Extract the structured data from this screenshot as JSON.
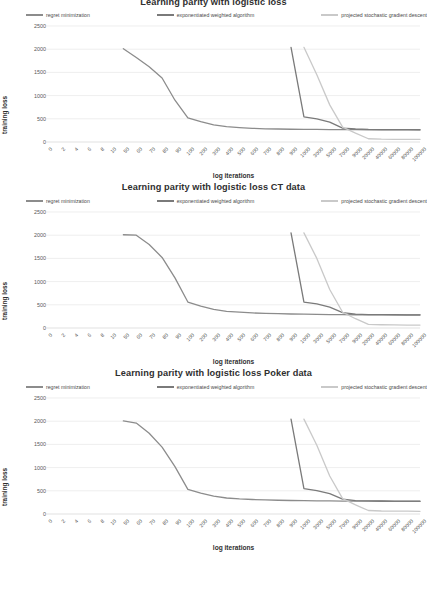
{
  "figure": {
    "background": "#ffffff",
    "series_colors": {
      "regret_minimization": "#8c8c8c",
      "exponentiated_weighted_algorithm": "#7a7a7a",
      "projected_stochastic_gradient_descent": "#c9c9c9"
    },
    "gridline_color": "#e2e2e2",
    "axis_color": "#d9d9d9"
  },
  "charts": [
    {
      "title": "Learning parity with logistic loss",
      "title_clipped": true,
      "legend": [
        {
          "label": "regret minimization",
          "color": "#8c8c8c"
        },
        {
          "label": "exponentiated weighted algorithm",
          "color": "#7a7a7a"
        },
        {
          "label": "projected stochastic gradient descent",
          "color": "#c9c9c9"
        }
      ],
      "chart_data": {
        "type": "line",
        "title": "Learning parity with logistic loss",
        "xlabel": "log iterations",
        "ylabel": "training loss",
        "ylim": [
          0,
          2500
        ],
        "yticks": [
          0,
          500,
          1000,
          1500,
          2000,
          2500
        ],
        "grid": true,
        "legend_position": "top",
        "categories": [
          "0",
          "2",
          "4",
          "6",
          "8",
          "10",
          "50",
          "60",
          "70",
          "80",
          "90",
          "100",
          "200",
          "300",
          "400",
          "500",
          "600",
          "700",
          "800",
          "900",
          "1000",
          "3000",
          "5000",
          "7000",
          "9000",
          "20000",
          "40000",
          "60000",
          "80000",
          "100000"
        ],
        "series": [
          {
            "name": "regret minimization",
            "color": "#8c8c8c",
            "values": [
              null,
              null,
              null,
              null,
              null,
              null,
              2010,
              1820,
              1620,
              1380,
              900,
              520,
              440,
              370,
              330,
              310,
              295,
              285,
              280,
              275,
              272,
              270,
              268,
              266,
              265,
              263,
              262,
              261,
              260,
              260
            ]
          },
          {
            "name": "exponentiated weighted algorithm",
            "color": "#7a7a7a",
            "values": [
              null,
              null,
              null,
              null,
              null,
              null,
              null,
              null,
              null,
              null,
              null,
              null,
              null,
              null,
              null,
              null,
              null,
              null,
              null,
              2040,
              540,
              500,
              430,
              300,
              280,
              270,
              268,
              266,
              265,
              264
            ]
          },
          {
            "name": "projected stochastic gradient descent",
            "color": "#c9c9c9",
            "values": [
              null,
              null,
              null,
              null,
              null,
              null,
              null,
              null,
              null,
              null,
              null,
              null,
              null,
              null,
              null,
              null,
              null,
              null,
              null,
              null,
              2040,
              1450,
              800,
              320,
              190,
              70,
              60,
              58,
              56,
              55
            ]
          }
        ]
      }
    },
    {
      "title": "Learning parity with logistic loss CT data",
      "title_clipped": false,
      "legend": [
        {
          "label": "regret minimization",
          "color": "#8c8c8c"
        },
        {
          "label": "exponentiated weighted algorithm",
          "color": "#7a7a7a"
        },
        {
          "label": "projected stochastic gradient descent",
          "color": "#c9c9c9"
        }
      ],
      "chart_data": {
        "type": "line",
        "title": "Learning parity with logistic loss CT data",
        "xlabel": "log iterations",
        "ylabel": "training loss",
        "ylim": [
          0,
          2500
        ],
        "yticks": [
          0,
          500,
          1000,
          1500,
          2000,
          2500
        ],
        "grid": true,
        "legend_position": "top",
        "categories": [
          "0",
          "2",
          "4",
          "6",
          "8",
          "10",
          "50",
          "60",
          "70",
          "80",
          "90",
          "100",
          "200",
          "300",
          "400",
          "500",
          "600",
          "700",
          "800",
          "900",
          "1000",
          "3000",
          "5000",
          "7000",
          "9000",
          "20000",
          "40000",
          "60000",
          "80000",
          "100000"
        ],
        "series": [
          {
            "name": "regret minimization",
            "color": "#8c8c8c",
            "values": [
              null,
              null,
              null,
              null,
              null,
              null,
              2010,
              2000,
              1800,
              1520,
              1080,
              560,
              470,
              400,
              360,
              340,
              325,
              315,
              308,
              302,
              298,
              294,
              290,
              288,
              286,
              284,
              282,
              281,
              280,
              280
            ]
          },
          {
            "name": "exponentiated weighted algorithm",
            "color": "#7a7a7a",
            "values": [
              null,
              null,
              null,
              null,
              null,
              null,
              null,
              null,
              null,
              null,
              null,
              null,
              null,
              null,
              null,
              null,
              null,
              null,
              null,
              2050,
              560,
              520,
              450,
              330,
              300,
              290,
              288,
              286,
              285,
              284
            ]
          },
          {
            "name": "projected stochastic gradient descent",
            "color": "#c9c9c9",
            "values": [
              null,
              null,
              null,
              null,
              null,
              null,
              null,
              null,
              null,
              null,
              null,
              null,
              null,
              null,
              null,
              null,
              null,
              null,
              null,
              null,
              2050,
              1500,
              830,
              340,
              200,
              80,
              70,
              66,
              64,
              62
            ]
          }
        ]
      }
    },
    {
      "title": "Learning parity with logistic loss Poker data",
      "title_clipped": false,
      "legend": [
        {
          "label": "regret minimization",
          "color": "#8c8c8c"
        },
        {
          "label": "exponentiated weighted algorithm",
          "color": "#7a7a7a"
        },
        {
          "label": "projected stochastic gradient descent",
          "color": "#c9c9c9"
        }
      ],
      "chart_data": {
        "type": "line",
        "title": "Learning parity with logistic loss Poker data",
        "xlabel": "log iterations",
        "ylabel": "training loss",
        "ylim": [
          0,
          2500
        ],
        "yticks": [
          0,
          500,
          1000,
          1500,
          2000,
          2500
        ],
        "grid": true,
        "legend_position": "top",
        "categories": [
          "0",
          "2",
          "4",
          "6",
          "8",
          "10",
          "50",
          "60",
          "70",
          "80",
          "90",
          "100",
          "200",
          "300",
          "400",
          "500",
          "600",
          "700",
          "800",
          "900",
          "1000",
          "3000",
          "5000",
          "7000",
          "9000",
          "20000",
          "40000",
          "60000",
          "80000",
          "100000"
        ],
        "series": [
          {
            "name": "regret minimization",
            "color": "#8c8c8c",
            "values": [
              null,
              null,
              null,
              null,
              null,
              null,
              2005,
              1960,
              1740,
              1440,
              1020,
              530,
              450,
              385,
              345,
              325,
              312,
              303,
              296,
              291,
              287,
              283,
              281,
              279,
              277,
              276,
              275,
              274,
              273,
              272
            ]
          },
          {
            "name": "exponentiated weighted algorithm",
            "color": "#7a7a7a",
            "values": [
              null,
              null,
              null,
              null,
              null,
              null,
              null,
              null,
              null,
              null,
              null,
              null,
              null,
              null,
              null,
              null,
              null,
              null,
              null,
              2045,
              545,
              505,
              440,
              320,
              290,
              282,
              280,
              278,
              277,
              276
            ]
          },
          {
            "name": "projected stochastic gradient descent",
            "color": "#c9c9c9",
            "values": [
              null,
              null,
              null,
              null,
              null,
              null,
              null,
              null,
              null,
              null,
              null,
              null,
              null,
              null,
              null,
              null,
              null,
              null,
              null,
              null,
              2045,
              1480,
              820,
              330,
              195,
              75,
              65,
              62,
              60,
              58
            ]
          }
        ]
      }
    }
  ]
}
